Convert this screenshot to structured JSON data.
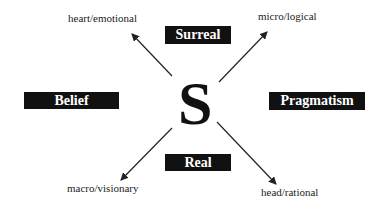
{
  "center": {
    "letter": "S"
  },
  "boxes": {
    "top": "Surreal",
    "left": "Belief",
    "right": "Pragmatism",
    "bottom": "Real"
  },
  "corners": {
    "top_left": "heart/emotional",
    "top_right": "micro/logical",
    "bottom_left": "macro/visionary",
    "bottom_right": "head/rational"
  },
  "colors": {
    "box_bg": "#111111",
    "box_text": "#ffffff",
    "line": "#222222"
  }
}
